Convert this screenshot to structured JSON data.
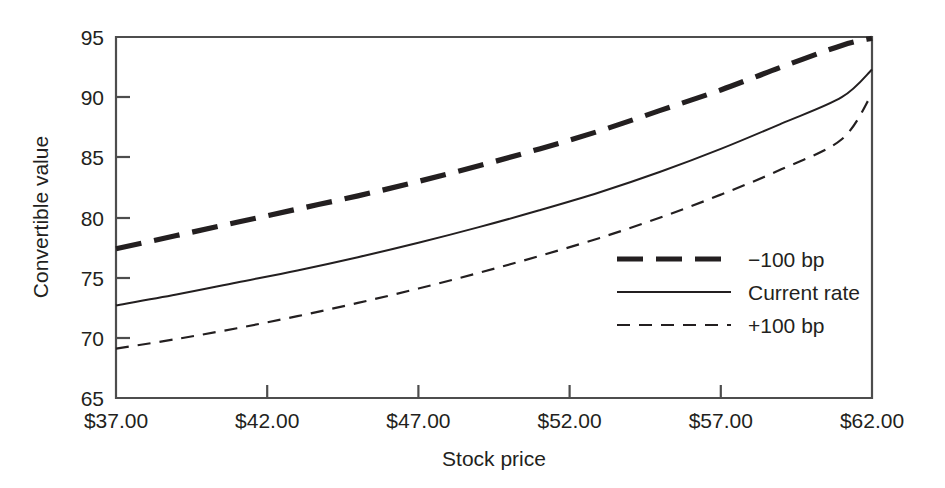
{
  "chart_data": {
    "type": "line",
    "title": "",
    "xlabel": "Stock price",
    "ylabel": "Convertible value",
    "xlim": [
      37,
      62
    ],
    "ylim": [
      65,
      95
    ],
    "grid": false,
    "legend_position": "inside-right",
    "x_tick_labels": [
      "$37.00",
      "$42.00",
      "$47.00",
      "$52.00",
      "$57.00",
      "$62.00"
    ],
    "x_ticks": [
      37,
      42,
      47,
      52,
      57,
      62
    ],
    "y_tick_labels": [
      "95",
      "90",
      "85",
      "80",
      "75",
      "70",
      "65"
    ],
    "y_ticks": [
      95,
      90,
      85,
      80,
      75,
      70,
      65
    ],
    "x": [
      37,
      39,
      41,
      43,
      45,
      47,
      49,
      51,
      53,
      55,
      57,
      59,
      61,
      62
    ],
    "series": [
      {
        "name": "-100 bp",
        "label": "−100 bp",
        "style": "thick-dashed",
        "color": "#231f20",
        "values": [
          77.4,
          78.5,
          79.6,
          80.7,
          81.8,
          83.0,
          84.3,
          85.7,
          87.2,
          88.9,
          90.6,
          92.5,
          94.3,
          94.9
        ]
      },
      {
        "name": "Current rate",
        "label": "Current rate",
        "style": "solid",
        "color": "#231f20",
        "values": [
          72.7,
          73.6,
          74.6,
          75.6,
          76.7,
          77.9,
          79.2,
          80.6,
          82.1,
          83.8,
          85.7,
          87.8,
          90.0,
          92.3
        ]
      },
      {
        "name": "+100 bp",
        "label": "+100 bp",
        "style": "thin-dashed",
        "color": "#231f20",
        "values": [
          69.1,
          69.9,
          70.8,
          71.8,
          72.9,
          74.1,
          75.4,
          76.8,
          78.3,
          80.0,
          81.9,
          84.0,
          86.5,
          90.3
        ]
      }
    ]
  },
  "legend": {
    "entries": [
      {
        "label": "−100 bp",
        "style": "thick-dashed"
      },
      {
        "label": "Current rate",
        "style": "solid"
      },
      {
        "label": "+100 bp",
        "style": "thin-dashed"
      }
    ]
  },
  "axes": {
    "x_title": "Stock price",
    "y_title": "Convertible value"
  }
}
